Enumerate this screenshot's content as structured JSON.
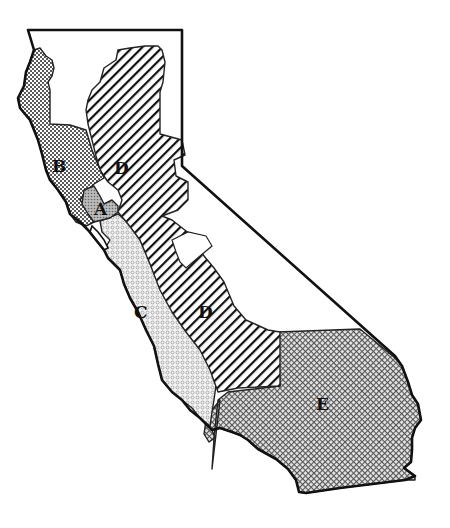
{
  "map": {
    "subject": "California regions",
    "regions": [
      {
        "id": "A",
        "label": "A",
        "pattern": "fine-gray-dots"
      },
      {
        "id": "B",
        "label": "B",
        "pattern": "dense-dots"
      },
      {
        "id": "C",
        "label": "C",
        "pattern": "small-circles"
      },
      {
        "id": "D",
        "label": "D",
        "pattern": "diagonal-hatch"
      },
      {
        "id": "D2",
        "label": "D",
        "pattern": "diagonal-hatch"
      },
      {
        "id": "E",
        "label": "E",
        "pattern": "crosshatch"
      }
    ]
  }
}
